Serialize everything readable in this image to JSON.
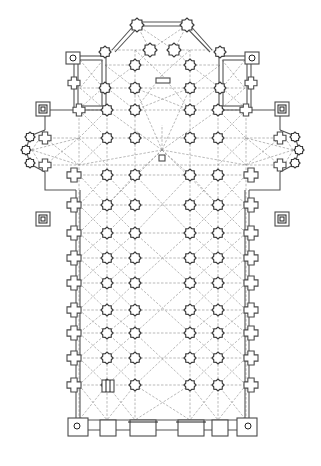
{
  "figure": {
    "type": "architectural-floor-plan",
    "colors": {
      "background": "#ffffff",
      "lines": "#3a3a3a",
      "vault_ribs": "#8a8a8a"
    },
    "nave_columns_x": [
      107,
      135,
      190,
      218
    ],
    "wall_x": [
      79,
      246
    ],
    "nave_rows_y": [
      175,
      205,
      233,
      258,
      283,
      310,
      333,
      358,
      385
    ],
    "crossing_rows_y": [
      110,
      138
    ],
    "choir_rows_y": [
      65,
      88
    ],
    "apse_piers": [
      [
        137,
        25
      ],
      [
        187,
        25
      ],
      [
        150,
        50
      ],
      [
        174,
        50
      ]
    ],
    "facade_portals": 5,
    "labels": []
  }
}
